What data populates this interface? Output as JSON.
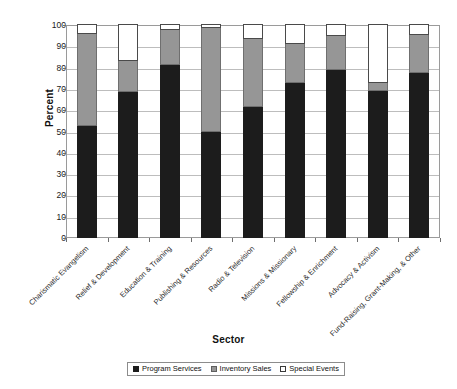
{
  "chart_data": {
    "type": "bar",
    "stacked": true,
    "title": "",
    "xlabel": "Sector",
    "ylabel": "Percent",
    "ylim": [
      0,
      100
    ],
    "ytick_step": 10,
    "yticks": [
      0,
      10,
      20,
      30,
      40,
      50,
      60,
      70,
      80,
      90,
      100
    ],
    "grid": true,
    "grid_axis": "y",
    "legend_position": "bottom",
    "categories": [
      "Charismatic Evangelism",
      "Relief & Development",
      "Education & Training",
      "Publishing & Resources",
      "Radio & Television",
      "Missions & Missionary",
      "Fellowship & Enrichment",
      "Advocacy & Activism",
      "Fund-Raising, Grant-Making, & Other"
    ],
    "series": [
      {
        "name": "Program Services",
        "color": "#1c1c1c",
        "values": [
          52.5,
          68.5,
          81.0,
          50.0,
          61.5,
          73.0,
          79.0,
          69.0,
          77.5
        ]
      },
      {
        "name": "Inventory Sales",
        "color": "#969696",
        "values": [
          43.5,
          14.5,
          16.5,
          48.5,
          32.0,
          18.0,
          16.0,
          4.0,
          18.0
        ]
      },
      {
        "name": "Special Events",
        "color": "#ffffff",
        "values": [
          4.0,
          17.0,
          2.5,
          1.5,
          6.5,
          9.0,
          5.0,
          27.0,
          4.5
        ]
      }
    ],
    "cumulative_tops": {
      "program": [
        52.5,
        68.5,
        81.0,
        50.0,
        61.5,
        73.0,
        79.0,
        69.0,
        77.5
      ],
      "inventory": [
        96.0,
        83.0,
        97.5,
        98.5,
        93.5,
        91.0,
        95.0,
        73.0,
        95.5
      ],
      "special": [
        100,
        100,
        100,
        100,
        100,
        100,
        100,
        100,
        100
      ]
    }
  },
  "axes": {
    "y_title": "Percent",
    "x_title": "Sector",
    "y_tick_labels": [
      "100",
      "90",
      "80",
      "70",
      "60",
      "50",
      "40",
      "30",
      "20",
      "10",
      "0"
    ]
  },
  "legend": {
    "items": [
      {
        "label": "Program Services",
        "color": "#1c1c1c"
      },
      {
        "label": "Inventory Sales",
        "color": "#969696"
      },
      {
        "label": "Special Events",
        "color": "#ffffff"
      }
    ]
  }
}
